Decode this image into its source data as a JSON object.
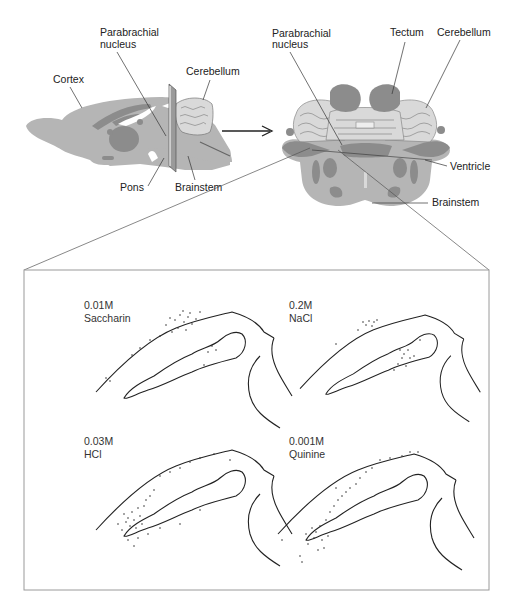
{
  "figure": {
    "sagittal_view": {
      "labels": {
        "parabrachial_line1": "Parabrachial",
        "parabrachial_line2": "nucleus",
        "cortex": "Cortex",
        "cerebellum": "Cerebellum",
        "pons": "Pons",
        "brainstem": "Brainstem"
      }
    },
    "coronal_view": {
      "labels": {
        "parabrachial_line1": "Parabrachial",
        "parabrachial_line2": "nucleus",
        "tectum": "Tectum",
        "cerebellum": "Cerebellum",
        "ventricle": "Ventricle",
        "brainstem": "Brainstem"
      }
    },
    "panels": [
      {
        "concentration": "0.01M",
        "tastant": "Saccharin"
      },
      {
        "concentration": "0.2M",
        "tastant": "NaCl"
      },
      {
        "concentration": "0.03M",
        "tastant": "HCl"
      },
      {
        "concentration": "0.001M",
        "tastant": "Quinine"
      }
    ],
    "colors": {
      "tissue": "#b5b5b5",
      "tissue_dark": "#8c8c8c",
      "tissue_light": "#d9d9d9",
      "line": "#222222",
      "frame": "#9a9a9a"
    }
  }
}
